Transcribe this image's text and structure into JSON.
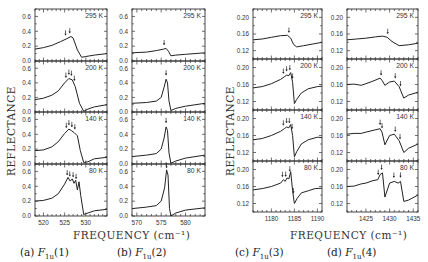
{
  "figure": {
    "ylabel": "REFLECTANCE",
    "xlabel": "FREQUENCY (cm⁻¹)",
    "captions": [
      {
        "prefix": "(a) ",
        "sym": "F",
        "sub": "1u",
        "suffix": "(1)"
      },
      {
        "prefix": "(b) ",
        "sym": "F",
        "sub": "1u",
        "suffix": "(2)"
      },
      {
        "prefix": "(c) ",
        "sym": "F",
        "sub": "1u",
        "suffix": "(3)"
      },
      {
        "prefix": "(d) ",
        "sym": "F",
        "sub": "1u",
        "suffix": "(4)"
      }
    ]
  },
  "chart_data": [
    {
      "type": "line",
      "title": "(a) F1u(1)",
      "xlabel": "FREQUENCY (cm-1)",
      "ylabel": "REFLECTANCE",
      "xlim": [
        518,
        535
      ],
      "ylim": [
        0.0,
        0.7
      ],
      "xticks": [
        520,
        525,
        530
      ],
      "yticks": [
        0.0,
        0.2,
        0.4,
        0.6
      ],
      "ytick_labels": [
        "0.0",
        "0.2",
        "0.4",
        "0.6"
      ],
      "rows": [
        {
          "temperature": "295 K",
          "x": [
            518,
            520,
            522,
            524,
            525.5,
            526.5,
            527,
            528,
            529,
            530,
            532,
            535
          ],
          "y": [
            0.16,
            0.18,
            0.21,
            0.26,
            0.3,
            0.33,
            0.31,
            0.15,
            0.05,
            0.06,
            0.08,
            0.1
          ],
          "arrows": [
            525.2,
            526.2
          ]
        },
        {
          "temperature": "200 K",
          "x": [
            518,
            520,
            522,
            523.5,
            525,
            526,
            526.8,
            527.5,
            528.5,
            529.5,
            530.5,
            532,
            535
          ],
          "y": [
            0.17,
            0.19,
            0.23,
            0.29,
            0.4,
            0.46,
            0.44,
            0.35,
            0.12,
            0.01,
            0.04,
            0.07,
            0.1
          ],
          "arrows": [
            525.3,
            526.0,
            526.6,
            527.3
          ]
        },
        {
          "temperature": "140 K",
          "x": [
            518,
            520,
            522,
            523.5,
            525,
            526,
            526.6,
            527.3,
            528,
            528.7,
            529.5,
            530.5,
            532,
            535
          ],
          "y": [
            0.18,
            0.19,
            0.23,
            0.3,
            0.41,
            0.47,
            0.45,
            0.42,
            0.38,
            0.18,
            0.02,
            0.03,
            0.07,
            0.09
          ],
          "arrows": [
            525.4,
            526.0,
            526.7,
            527.4
          ]
        },
        {
          "temperature": "80 K",
          "x": [
            518,
            520,
            522,
            523.5,
            525,
            525.8,
            526.3,
            526.8,
            527.2,
            527.6,
            528.0,
            528.4,
            528.8,
            529.5,
            530.5,
            532,
            535
          ],
          "y": [
            0.2,
            0.21,
            0.24,
            0.3,
            0.43,
            0.52,
            0.47,
            0.5,
            0.44,
            0.48,
            0.35,
            0.46,
            0.28,
            0.02,
            0.04,
            0.07,
            0.09
          ],
          "arrows": [
            525.6,
            526.2,
            527.0,
            527.7
          ]
        }
      ]
    },
    {
      "type": "line",
      "title": "(b) F1u(2)",
      "xlabel": "FREQUENCY (cm-1)",
      "ylabel": "REFLECTANCE",
      "xlim": [
        569,
        584
      ],
      "ylim": [
        0.0,
        0.7
      ],
      "xticks": [
        570,
        575,
        580
      ],
      "yticks": [
        0.0,
        0.2,
        0.4,
        0.6
      ],
      "ytick_labels": [
        "0.0",
        "0.2",
        "0.4",
        "0.6"
      ],
      "rows": [
        {
          "temperature": "295 K",
          "x": [
            569,
            572,
            574,
            575.5,
            576,
            576.5,
            577,
            578,
            580,
            584
          ],
          "y": [
            0.11,
            0.12,
            0.14,
            0.16,
            0.17,
            0.13,
            0.07,
            0.08,
            0.09,
            0.11
          ],
          "arrows": [
            575.6
          ]
        },
        {
          "temperature": "200 K",
          "x": [
            569,
            572,
            574,
            575,
            575.6,
            576,
            576.3,
            576.6,
            577,
            578,
            580,
            584
          ],
          "y": [
            0.12,
            0.13,
            0.15,
            0.2,
            0.34,
            0.45,
            0.4,
            0.15,
            0.02,
            0.05,
            0.08,
            0.12
          ],
          "arrows": [
            576.0
          ]
        },
        {
          "temperature": "140 K",
          "x": [
            569,
            572,
            574,
            575,
            575.6,
            576,
            576.3,
            576.6,
            577,
            578,
            580,
            584
          ],
          "y": [
            0.1,
            0.12,
            0.14,
            0.2,
            0.35,
            0.5,
            0.45,
            0.15,
            0.01,
            0.04,
            0.08,
            0.12
          ],
          "arrows": [
            576.0
          ]
        },
        {
          "temperature": "80 K",
          "x": [
            569,
            572,
            574,
            575,
            575.7,
            576.1,
            576.4,
            576.7,
            577,
            578,
            580,
            584
          ],
          "y": [
            0.1,
            0.12,
            0.14,
            0.2,
            0.38,
            0.62,
            0.55,
            0.1,
            0.0,
            0.04,
            0.08,
            0.11
          ],
          "arrows": [
            576.1
          ]
        }
      ]
    },
    {
      "type": "line",
      "title": "(c) F1u(3)",
      "xlabel": "FREQUENCY (cm-1)",
      "ylabel": "REFLECTANCE",
      "xlim": [
        1176,
        1191
      ],
      "ylim": [
        0.1,
        0.22
      ],
      "xticks": [
        1180,
        1185,
        1190
      ],
      "yticks": [
        0.12,
        0.16,
        0.2
      ],
      "ytick_labels": [
        "0.12",
        "0.16",
        "0.20"
      ],
      "rows": [
        {
          "temperature": "295 K",
          "x": [
            1176,
            1178,
            1180,
            1182,
            1183.5,
            1184.2,
            1184.8,
            1185.5,
            1187,
            1189,
            1191
          ],
          "y": [
            0.146,
            0.148,
            0.152,
            0.156,
            0.157,
            0.15,
            0.135,
            0.129,
            0.132,
            0.136,
            0.14
          ],
          "arrows": [
            1183.8
          ]
        },
        {
          "temperature": "200 K",
          "x": [
            1176,
            1178,
            1180,
            1182,
            1182.8,
            1183.3,
            1183.8,
            1184.2,
            1184.6,
            1185,
            1185.5,
            1186.5,
            1188,
            1190,
            1191
          ],
          "y": [
            0.152,
            0.155,
            0.162,
            0.172,
            0.178,
            0.182,
            0.181,
            0.188,
            0.165,
            0.115,
            0.125,
            0.14,
            0.15,
            0.155,
            0.156
          ],
          "arrows": [
            1182.6,
            1183.3,
            1184.0,
            1184.6
          ]
        },
        {
          "temperature": "140 K",
          "x": [
            1176,
            1178,
            1180,
            1182,
            1182.8,
            1183.3,
            1183.8,
            1184.2,
            1184.6,
            1185,
            1185.5,
            1186.5,
            1188,
            1190,
            1191
          ],
          "y": [
            0.15,
            0.153,
            0.16,
            0.17,
            0.176,
            0.18,
            0.178,
            0.186,
            0.16,
            0.11,
            0.122,
            0.14,
            0.15,
            0.156,
            0.155
          ],
          "arrows": [
            1182.6,
            1183.3,
            1183.9,
            1184.5
          ]
        },
        {
          "temperature": "80 K",
          "x": [
            1176,
            1178,
            1180,
            1182,
            1182.6,
            1183,
            1183.4,
            1183.8,
            1184.2,
            1184.6,
            1185,
            1185.6,
            1186.5,
            1188,
            1189.5,
            1191
          ],
          "y": [
            0.152,
            0.155,
            0.16,
            0.168,
            0.176,
            0.172,
            0.18,
            0.178,
            0.195,
            0.15,
            0.12,
            0.132,
            0.145,
            0.15,
            0.155,
            0.156
          ],
          "arrows": [
            1182.4,
            1183.1,
            1184.0,
            1184.8
          ]
        }
      ]
    },
    {
      "type": "line",
      "title": "(d) F1u(4)",
      "xlabel": "FREQUENCY (cm-1)",
      "ylabel": "REFLECTANCE",
      "xlim": [
        1421,
        1436
      ],
      "ylim": [
        0.1,
        0.22
      ],
      "xticks": [
        1425,
        1430,
        1435
      ],
      "yticks": [
        0.12,
        0.16,
        0.2
      ],
      "ytick_labels": [
        "0.12",
        "0.16",
        "0.20"
      ],
      "rows": [
        {
          "temperature": "295 K",
          "x": [
            1421,
            1423,
            1425,
            1427,
            1428.5,
            1429.5,
            1430.5,
            1432,
            1434,
            1436
          ],
          "y": [
            0.146,
            0.148,
            0.15,
            0.153,
            0.155,
            0.152,
            0.142,
            0.132,
            0.134,
            0.138
          ],
          "arrows": [
            1429.6
          ]
        },
        {
          "temperature": "200 K",
          "x": [
            1421,
            1422.5,
            1424,
            1425,
            1426.5,
            1428,
            1428.4,
            1429,
            1430,
            1431,
            1432,
            1433,
            1434,
            1436
          ],
          "y": [
            0.16,
            0.161,
            0.158,
            0.162,
            0.168,
            0.175,
            0.17,
            0.158,
            0.166,
            0.168,
            0.155,
            0.128,
            0.135,
            0.142
          ],
          "arrows": [
            1428.2,
            1431.2,
            1432.3
          ]
        },
        {
          "temperature": "140 K",
          "x": [
            1421,
            1422.5,
            1424,
            1425,
            1426.5,
            1428,
            1428.4,
            1429,
            1430,
            1431,
            1432,
            1433,
            1434,
            1436
          ],
          "y": [
            0.163,
            0.165,
            0.165,
            0.168,
            0.172,
            0.176,
            0.168,
            0.138,
            0.16,
            0.163,
            0.148,
            0.12,
            0.13,
            0.14
          ],
          "arrows": [
            1428.0,
            1428.4,
            1431.2,
            1432.2
          ]
        },
        {
          "temperature": "80 K",
          "x": [
            1421,
            1422.5,
            1424,
            1425,
            1426.5,
            1427.5,
            1428,
            1428.5,
            1429,
            1430,
            1431,
            1431.8,
            1432.3,
            1433,
            1434,
            1436
          ],
          "y": [
            0.16,
            0.161,
            0.166,
            0.168,
            0.174,
            0.176,
            0.188,
            0.192,
            0.135,
            0.168,
            0.172,
            0.168,
            0.172,
            0.125,
            0.128,
            0.14
          ],
          "arrows": [
            1427.6,
            1428.3,
            1430.9,
            1432.3
          ]
        }
      ]
    }
  ]
}
